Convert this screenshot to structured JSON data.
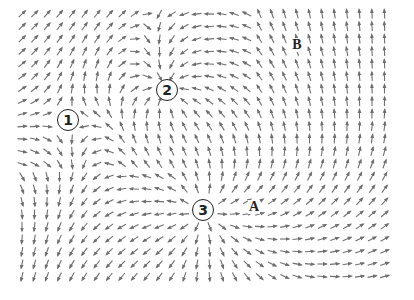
{
  "diagram": {
    "type": "vector-field",
    "arrow_color": "#6e6e6e",
    "background": "#ffffff",
    "grid": {
      "x_start": 22,
      "x_end": 390,
      "y_start": 14,
      "y_end": 286,
      "spacing": 12.5,
      "arrow_length": 9
    },
    "critical_points": [
      {
        "id": "1",
        "label": "1",
        "x": 68,
        "y": 120,
        "kind": "saddle"
      },
      {
        "id": "2",
        "label": "2",
        "x": 167,
        "y": 90,
        "kind": "sink"
      },
      {
        "id": "3",
        "label": "3",
        "x": 203,
        "y": 210,
        "kind": "source"
      }
    ],
    "point_labels": [
      {
        "id": "A",
        "label": "A",
        "x": 254,
        "y": 207
      },
      {
        "id": "B",
        "label": "B",
        "x": 297,
        "y": 45
      }
    ]
  }
}
